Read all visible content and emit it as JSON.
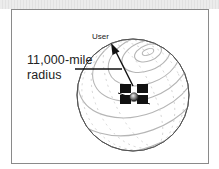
{
  "diagram": {
    "labels": {
      "radius_line1": "11,000-mile",
      "radius_line2": "radius",
      "user": "User"
    },
    "elements": {
      "sphere": "orbit-sphere",
      "satellite": "satellite-icon",
      "arrow": "radius-arrow-to-user"
    },
    "colors": {
      "frame_border": "#8a8a8a",
      "sphere_outline": "#555555",
      "latitude_lines": "#b5b5b5",
      "ink": "#111111"
    }
  }
}
